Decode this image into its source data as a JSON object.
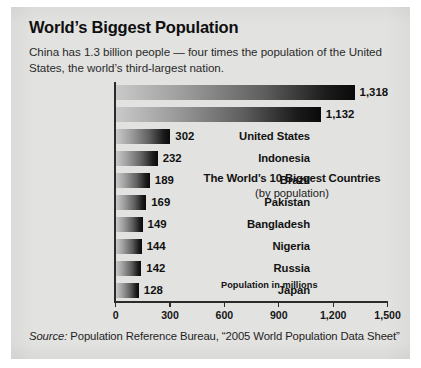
{
  "panel": {
    "background_color": "#e2e2e0"
  },
  "header": {
    "title": "World’s Biggest Population",
    "subtitle": "China has 1.3 billion people — four times the population of the United States, the world’s third-largest nation."
  },
  "inner_caption": {
    "title": "The World’s 10 Biggest Countries",
    "subtitle": "(by population)"
  },
  "axis_title": "Population in millions",
  "source": {
    "label": "Source:",
    "text": " Population Reference Bureau, “2005 World Population Data Sheet”"
  },
  "chart_data": {
    "type": "bar",
    "orientation": "horizontal",
    "title": "World’s Biggest Population",
    "subtitle": "The World’s 10 Biggest Countries (by population)",
    "xlabel": "Population in millions",
    "ylabel": "",
    "xlim": [
      0,
      1500
    ],
    "xticks": [
      0,
      300,
      600,
      900,
      1200,
      1500
    ],
    "xtick_labels": [
      "0",
      "300",
      "600",
      "900",
      "1,200",
      "1,500"
    ],
    "grid": false,
    "legend": false,
    "units": "millions",
    "bar_gradient": [
      "#c9c9c9",
      "#0a0a0a"
    ],
    "categories": [
      "China",
      "India",
      "United States",
      "Indonesia",
      "Brazil",
      "Pakistan",
      "Bangladesh",
      "Nigeria",
      "Russia",
      "Japan"
    ],
    "values": [
      1318,
      1132,
      302,
      232,
      189,
      169,
      149,
      144,
      142,
      128
    ],
    "value_labels": [
      "1,318",
      "1,132",
      "302",
      "232",
      "189",
      "169",
      "149",
      "144",
      "142",
      "128"
    ]
  }
}
